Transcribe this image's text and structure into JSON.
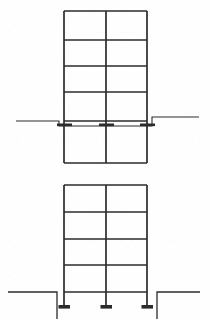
{
  "document": {
    "kind": "structural-frame-elevation-drawing",
    "background_color": "#fefefe",
    "line_color": "#2b2b2b",
    "width": 212,
    "height": 319,
    "views_count": 2
  },
  "views": [
    {
      "id": "upper-frame-elevation",
      "name": "Upper frame elevation",
      "frame": {
        "left_column_x": 64,
        "middle_column_x": 106,
        "right_column_x": 147,
        "top_y": 11,
        "bottom_y": 163,
        "column_line_width": 1.7,
        "beam_line_width": 1.5,
        "bay_count": 2,
        "story_count": 5,
        "beam_levels_y": [
          11,
          40,
          66,
          92,
          121,
          163
        ],
        "story_heights_px": [
          29,
          26,
          26,
          29,
          42
        ]
      },
      "ground": {
        "name": "ground-line",
        "y_left": 121,
        "y_right": 117,
        "left_end_x": 16,
        "right_end_x": 199,
        "line_width": 1.1,
        "step_left_x": 59,
        "step_right_x": 146,
        "step_rise_px": 5
      },
      "connections": [
        {
          "name": "base-connection-left",
          "x": 64,
          "y": 124,
          "plate_width": 15,
          "plate_height": 3
        },
        {
          "name": "base-connection-middle",
          "x": 106,
          "y": 124,
          "plate_width": 15,
          "plate_height": 3
        },
        {
          "name": "base-connection-right",
          "x": 147,
          "y": 124,
          "plate_width": 15,
          "plate_height": 3
        }
      ]
    },
    {
      "id": "lower-frame-elevation",
      "name": "Lower frame elevation",
      "frame": {
        "left_column_x": 64,
        "middle_column_x": 106,
        "right_column_x": 147,
        "top_y": 185,
        "bottom_y": 305,
        "column_line_width": 1.7,
        "beam_line_width": 1.5,
        "bay_count": 2,
        "story_count": 5,
        "beam_levels_y": [
          185,
          212,
          239,
          265,
          292
        ],
        "story_heights_px": [
          27,
          27,
          26,
          27,
          13
        ]
      },
      "ground": {
        "name": "ground-line",
        "y": 292,
        "left_end_x": 8,
        "right_end_x": 200,
        "line_width": 1.3,
        "pit_left_x": 57,
        "pit_right_x": 157,
        "pit_depth_px": 27
      },
      "base_plates": [
        {
          "name": "base-plate-left",
          "x": 64,
          "y": 305,
          "width": 12,
          "height": 4
        },
        {
          "name": "base-plate-middle",
          "x": 106,
          "y": 305,
          "width": 12,
          "height": 4
        },
        {
          "name": "base-plate-right",
          "x": 147,
          "y": 305,
          "width": 12,
          "height": 4
        }
      ]
    }
  ]
}
